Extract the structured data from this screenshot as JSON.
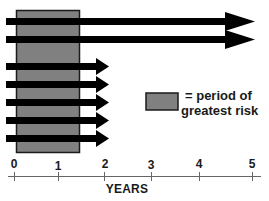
{
  "diagram": {
    "type": "timeline",
    "risk_period": {
      "start_year": 0,
      "end_year": 1.4,
      "fill": "#808080",
      "border": "#1a1a1a"
    },
    "arrows": [
      {
        "id": 1,
        "length": "long",
        "end_year": 5
      },
      {
        "id": 2,
        "length": "long",
        "end_year": 5
      },
      {
        "id": 3,
        "length": "short",
        "end_year": 2
      },
      {
        "id": 4,
        "length": "short",
        "end_year": 2
      },
      {
        "id": 5,
        "length": "short",
        "end_year": 2
      },
      {
        "id": 6,
        "length": "short",
        "end_year": 2
      },
      {
        "id": 7,
        "length": "short",
        "end_year": 2
      }
    ],
    "arrow_color": "#000000",
    "legend": {
      "line1": "= period of",
      "line2": "greatest risk"
    },
    "axis": {
      "title": "YEARS",
      "ticks": [
        "0",
        "1",
        "2",
        "3",
        "4",
        "5"
      ],
      "color": "#555555"
    }
  }
}
